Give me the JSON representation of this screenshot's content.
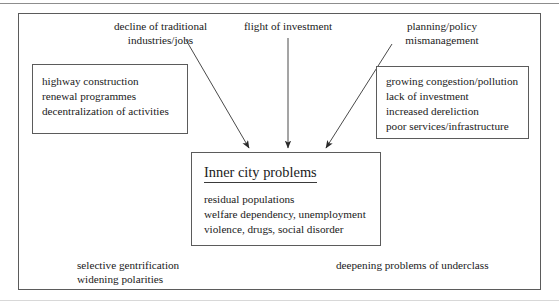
{
  "figure": {
    "kind": "flow-diagram",
    "ink_color": "#1a1a1a",
    "line_color": "#5b5b5b",
    "background": "#ffffff"
  },
  "causes": {
    "left": {
      "lines": [
        "decline of traditional",
        "industries/jobs"
      ]
    },
    "middle": {
      "lines": [
        "flight of investment"
      ]
    },
    "right": {
      "lines": [
        "planning/policy",
        "mismanagement"
      ]
    }
  },
  "left_box": {
    "lines": [
      "highway construction",
      "renewal programmes",
      "decentralization of activities"
    ]
  },
  "right_box": {
    "lines": [
      "growing congestion/pollution",
      "lack of investment",
      "increased dereliction",
      "poor services/infrastructure"
    ]
  },
  "center_box": {
    "title": "Inner city problems",
    "lines": [
      "residual populations",
      "welfare dependency, unemployment",
      "violence, drugs, social disorder"
    ]
  },
  "outcomes": {
    "left": {
      "lines": [
        "selective gentrification",
        "widening polarities"
      ]
    },
    "right": {
      "lines": [
        "deepening problems of underclass"
      ]
    }
  },
  "arrows": [
    {
      "name": "arrow-decline-to-center",
      "from": "decline of traditional industries/jobs",
      "to": "Inner city problems"
    },
    {
      "name": "arrow-flight-to-center",
      "from": "flight of investment",
      "to": "Inner city problems"
    },
    {
      "name": "arrow-planning-to-center",
      "from": "planning/policy mismanagement",
      "to": "Inner city problems"
    }
  ]
}
